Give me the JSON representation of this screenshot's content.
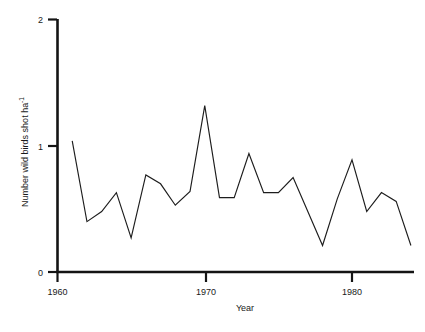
{
  "chart_data": {
    "type": "line",
    "title": "",
    "xlabel": "Year",
    "ylabel": "Number wild birds shot ha",
    "ylabel_superscript": "-1",
    "xlim": [
      1960,
      1984
    ],
    "ylim": [
      0,
      2
    ],
    "grid": false,
    "legend": null,
    "x_ticks": [
      1960,
      1970,
      1980
    ],
    "x_tick_labels": [
      "1960",
      "1970",
      "1980"
    ],
    "y_ticks": [
      0,
      1,
      2
    ],
    "y_tick_labels": [
      "0",
      "1",
      "2"
    ],
    "series": [
      {
        "name": "Wild birds shot per hectare",
        "x": [
          1961,
          1962,
          1963,
          1964,
          1965,
          1966,
          1967,
          1968,
          1969,
          1970,
          1971,
          1972,
          1973,
          1974,
          1975,
          1976,
          1977,
          1978,
          1979,
          1980,
          1981,
          1982,
          1983,
          1984
        ],
        "values": [
          1.04,
          0.4,
          0.48,
          0.63,
          0.27,
          0.77,
          0.7,
          0.53,
          0.64,
          1.32,
          0.59,
          0.59,
          0.94,
          0.63,
          0.63,
          0.75,
          0.48,
          0.21,
          0.58,
          0.89,
          0.48,
          0.63,
          0.56,
          0.21
        ]
      }
    ]
  },
  "axis": {
    "x_title": "Year",
    "y_title_main": "Number wild birds shot ha",
    "y_title_sup": "-1",
    "x_tick_1": "1960",
    "x_tick_2": "1970",
    "x_tick_3": "1980",
    "y_tick_0": "0",
    "y_tick_1": "1",
    "y_tick_2": "2"
  },
  "colors": {
    "line": "#1d1d1d",
    "axis": "#141414",
    "background": "#ffffff"
  }
}
